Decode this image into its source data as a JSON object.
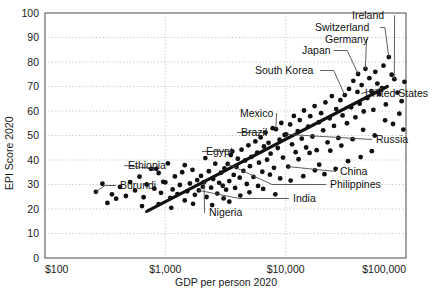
{
  "chart_data": {
    "type": "scatter",
    "title": "",
    "xlabel": "GDP per person 2020",
    "ylabel": "EPI Score 2020",
    "xscale": "log",
    "yscale": "linear",
    "xlim": [
      100,
      100000
    ],
    "ylim": [
      0,
      100
    ],
    "grid": true,
    "legend_position": "none",
    "xticks": [
      100,
      1000,
      10000,
      100000
    ],
    "xtick_labels": [
      "$100",
      "$1,000",
      "$10,000",
      "$100,000"
    ],
    "yticks": [
      0,
      10,
      20,
      30,
      40,
      50,
      60,
      70,
      80,
      90,
      100
    ],
    "ytick_labels": [
      "0",
      "10",
      "20",
      "30",
      "40",
      "50",
      "60",
      "70",
      "80",
      "90",
      "100"
    ],
    "marker_color": "#111111",
    "trendline": {
      "label": "",
      "color": "#111111",
      "x_start": 700,
      "y_start": 19,
      "x_end": 70000,
      "y_end": 70
    },
    "annotations": [
      {
        "label": "Ireland",
        "x": 80000,
        "y": 73,
        "label_x": 352,
        "label_y": 19,
        "leader": true
      },
      {
        "label": "Switzerland",
        "x": 72000,
        "y": 82,
        "label_x": 315,
        "label_y": 31,
        "leader": true
      },
      {
        "label": "Germany",
        "x": 46000,
        "y": 77.2,
        "label_x": 325,
        "label_y": 43,
        "leader": true
      },
      {
        "label": "Japan",
        "x": 40000,
        "y": 75.1,
        "label_x": 302,
        "label_y": 54,
        "leader": true
      },
      {
        "label": "South Korea",
        "x": 31000,
        "y": 66.5,
        "label_x": 255,
        "label_y": 74,
        "leader": true
      },
      {
        "label": "United States",
        "x": 63000,
        "y": 69.3,
        "label_x": 365,
        "label_y": 97,
        "leader": true
      },
      {
        "label": "Mexico",
        "x": 8300,
        "y": 52.6,
        "label_x": 240,
        "label_y": 117,
        "leader": true
      },
      {
        "label": "Brazil",
        "x": 6800,
        "y": 51.2,
        "label_x": 241,
        "label_y": 136,
        "leader": true
      },
      {
        "label": "Russia",
        "x": 10100,
        "y": 50.5,
        "label_x": 376,
        "label_y": 143,
        "leader": true
      },
      {
        "label": "Egypt",
        "x": 3600,
        "y": 43.5,
        "label_x": 206,
        "label_y": 155,
        "leader": true
      },
      {
        "label": "Ethiopia",
        "x": 840,
        "y": 36.4,
        "label_x": 128,
        "label_y": 169,
        "leader": true
      },
      {
        "label": "China",
        "x": 10500,
        "y": 37.3,
        "label_x": 340,
        "label_y": 175,
        "leader": true
      },
      {
        "label": "Philippines",
        "x": 3300,
        "y": 38.4,
        "label_x": 330,
        "label_y": 188,
        "leader": true
      },
      {
        "label": "Burundi",
        "x": 265,
        "y": 27.0,
        "label_x": 120,
        "label_y": 189,
        "leader": true
      },
      {
        "label": "India",
        "x": 1900,
        "y": 27.6,
        "label_x": 293,
        "label_y": 202,
        "leader": true
      },
      {
        "label": "Nigeria",
        "x": 2100,
        "y": 31.0,
        "label_x": 209,
        "label_y": 216,
        "leader": true
      }
    ],
    "points": [
      [
        265,
        27.0
      ],
      [
        300,
        30.3
      ],
      [
        330,
        22.5
      ],
      [
        360,
        26.0
      ],
      [
        390,
        24.2
      ],
      [
        420,
        29.0
      ],
      [
        470,
        25.3
      ],
      [
        510,
        31.0
      ],
      [
        560,
        27.6
      ],
      [
        610,
        33.2
      ],
      [
        660,
        24.8
      ],
      [
        700,
        30.0
      ],
      [
        760,
        36.4
      ],
      [
        810,
        28.3
      ],
      [
        840,
        36.4
      ],
      [
        880,
        22.0
      ],
      [
        920,
        26.6
      ],
      [
        960,
        31.1
      ],
      [
        1000,
        30.9
      ],
      [
        1050,
        38.6
      ],
      [
        1100,
        24.5
      ],
      [
        1150,
        28.0
      ],
      [
        1200,
        33.3
      ],
      [
        1260,
        26.1
      ],
      [
        1320,
        29.8
      ],
      [
        1380,
        35.0
      ],
      [
        1450,
        23.5
      ],
      [
        1520,
        27.2
      ],
      [
        1600,
        30.4
      ],
      [
        1680,
        36.0
      ],
      [
        1760,
        25.8
      ],
      [
        1840,
        31.8
      ],
      [
        1900,
        27.6
      ],
      [
        1980,
        33.5
      ],
      [
        2050,
        29.1
      ],
      [
        2100,
        31.0
      ],
      [
        2200,
        24.9
      ],
      [
        2300,
        35.4
      ],
      [
        2400,
        28.7
      ],
      [
        2500,
        32.2
      ],
      [
        2600,
        38.5
      ],
      [
        2700,
        26.3
      ],
      [
        2800,
        30.7
      ],
      [
        2900,
        34.8
      ],
      [
        3000,
        29.5
      ],
      [
        3100,
        36.6
      ],
      [
        3200,
        27.9
      ],
      [
        3300,
        38.4
      ],
      [
        3400,
        31.4
      ],
      [
        3500,
        42.0
      ],
      [
        3600,
        43.5
      ],
      [
        3700,
        33.9
      ],
      [
        3800,
        28.6
      ],
      [
        3900,
        37.1
      ],
      [
        4000,
        40.5
      ],
      [
        4150,
        32.8
      ],
      [
        4300,
        44.2
      ],
      [
        4450,
        35.6
      ],
      [
        4600,
        39.8
      ],
      [
        4750,
        30.2
      ],
      [
        4900,
        46.0
      ],
      [
        5050,
        37.5
      ],
      [
        5200,
        41.3
      ],
      [
        5400,
        33.1
      ],
      [
        5600,
        47.6
      ],
      [
        5800,
        43.0
      ],
      [
        6000,
        38.9
      ],
      [
        6200,
        49.2
      ],
      [
        6400,
        35.2
      ],
      [
        6600,
        45.5
      ],
      [
        6800,
        51.2
      ],
      [
        7000,
        40.1
      ],
      [
        7200,
        47.0
      ],
      [
        7500,
        42.6
      ],
      [
        7800,
        53.0
      ],
      [
        8000,
        36.8
      ],
      [
        8300,
        52.6
      ],
      [
        8600,
        44.9
      ],
      [
        8900,
        48.3
      ],
      [
        9200,
        55.1
      ],
      [
        9500,
        41.0
      ],
      [
        9800,
        50.2
      ],
      [
        10100,
        50.5
      ],
      [
        10500,
        37.3
      ],
      [
        10900,
        54.5
      ],
      [
        11300,
        46.4
      ],
      [
        11700,
        58.0
      ],
      [
        12100,
        43.2
      ],
      [
        12600,
        51.8
      ],
      [
        13100,
        56.3
      ],
      [
        13600,
        48.7
      ],
      [
        14200,
        60.2
      ],
      [
        14800,
        45.1
      ],
      [
        15400,
        53.6
      ],
      [
        16000,
        57.9
      ],
      [
        16700,
        49.6
      ],
      [
        17400,
        62.0
      ],
      [
        18100,
        44.0
      ],
      [
        18900,
        55.4
      ],
      [
        19700,
        59.1
      ],
      [
        20500,
        52.1
      ],
      [
        21400,
        63.5
      ],
      [
        22300,
        47.2
      ],
      [
        23200,
        57.0
      ],
      [
        24200,
        66.1
      ],
      [
        25200,
        53.9
      ],
      [
        26300,
        60.8
      ],
      [
        27400,
        49.0
      ],
      [
        28500,
        64.4
      ],
      [
        29700,
        58.2
      ],
      [
        31000,
        66.5
      ],
      [
        32300,
        55.0
      ],
      [
        33600,
        69.0
      ],
      [
        35000,
        61.5
      ],
      [
        36500,
        72.3
      ],
      [
        38000,
        57.4
      ],
      [
        39500,
        67.8
      ],
      [
        40000,
        75.1
      ],
      [
        41200,
        63.0
      ],
      [
        42800,
        70.6
      ],
      [
        44500,
        59.8
      ],
      [
        46000,
        77.2
      ],
      [
        47800,
        65.3
      ],
      [
        49600,
        73.4
      ],
      [
        51500,
        68.1
      ],
      [
        53500,
        60.5
      ],
      [
        55600,
        76.0
      ],
      [
        57800,
        71.2
      ],
      [
        60000,
        66.9
      ],
      [
        63000,
        69.3
      ],
      [
        65000,
        78.5
      ],
      [
        68000,
        62.7
      ],
      [
        72000,
        82.0
      ],
      [
        76000,
        74.8
      ],
      [
        80000,
        73.0
      ],
      [
        85000,
        67.5
      ],
      [
        92000,
        64.0
      ],
      [
        97000,
        71.9
      ],
      [
        2150,
        40.8
      ],
      [
        1450,
        37.9
      ],
      [
        3050,
        24.3
      ],
      [
        5900,
        29.4
      ],
      [
        7400,
        34.0
      ],
      [
        9000,
        32.5
      ],
      [
        12800,
        40.3
      ],
      [
        15800,
        42.9
      ],
      [
        19000,
        38.1
      ],
      [
        23500,
        43.8
      ],
      [
        29000,
        45.9
      ],
      [
        36000,
        48.5
      ],
      [
        44000,
        52.3
      ],
      [
        55000,
        50.0
      ],
      [
        67000,
        56.2
      ],
      [
        78000,
        54.7
      ],
      [
        88000,
        58.9
      ],
      [
        95000,
        52.4
      ],
      [
        640,
        21.2
      ],
      [
        880,
        34.7
      ],
      [
        1120,
        20.5
      ],
      [
        1700,
        22.1
      ],
      [
        2450,
        21.6
      ],
      [
        3400,
        23.0
      ],
      [
        4200,
        25.5
      ],
      [
        5000,
        26.8
      ],
      [
        6500,
        28.2
      ],
      [
        8200,
        26.0
      ],
      [
        11000,
        31.6
      ],
      [
        14000,
        33.4
      ],
      [
        17500,
        35.8
      ],
      [
        21000,
        34.2
      ],
      [
        26000,
        36.4
      ],
      [
        33000,
        39.5
      ],
      [
        42000,
        41.2
      ],
      [
        52000,
        43.6
      ]
    ]
  }
}
